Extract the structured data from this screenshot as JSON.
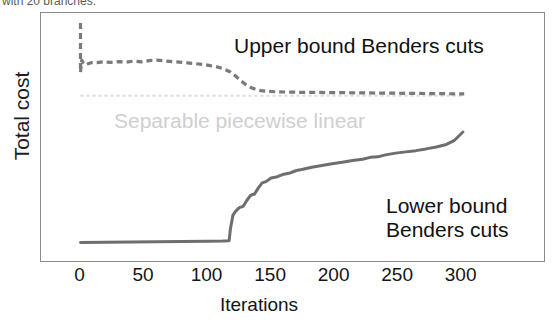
{
  "caption": {
    "text": "with 20 branches."
  },
  "chart_data": {
    "type": "line",
    "title": "",
    "subtitle": "",
    "xlabel": "Iterations",
    "ylabel": "Total cost",
    "xlim": [
      0,
      310
    ],
    "ylim": [
      0,
      100
    ],
    "grid": false,
    "legend_position": "in-plot annotations",
    "xticks": [
      0,
      50,
      100,
      150,
      200,
      250,
      300
    ],
    "xtick_labels": [
      "0",
      "50",
      "100",
      "150",
      "200",
      "250",
      "300"
    ],
    "yticks": [],
    "ytick_labels": [],
    "annotations": [
      {
        "name": "upper-bound-label",
        "text": "Upper bound Benders cuts",
        "color": "#111111"
      },
      {
        "name": "separable-label",
        "text": "Separable piecewise linear",
        "color": "#cfcfcf"
      },
      {
        "name": "lower-bound-label-line1",
        "text": "Lower bound",
        "color": "#111111"
      },
      {
        "name": "lower-bound-label-line2",
        "text": "Benders cuts",
        "color": "#111111"
      }
    ],
    "series": [
      {
        "name": "Upper bound Benders cuts",
        "style": "dashed",
        "color": "#7a7a7a",
        "x": [
          0,
          0,
          1,
          2,
          4,
          6,
          9,
          13,
          18,
          24,
          30,
          36,
          42,
          48,
          54,
          60,
          66,
          72,
          78,
          84,
          90,
          96,
          102,
          108,
          113,
          118,
          122,
          126,
          130,
          134,
          138,
          142,
          148,
          155,
          165,
          175,
          185,
          195,
          205,
          215,
          225,
          235,
          245,
          255,
          265,
          275,
          285,
          295,
          302
        ],
        "y": [
          96,
          76,
          81,
          80,
          79,
          79.5,
          80,
          80,
          80.3,
          80.1,
          80.4,
          80.2,
          80.6,
          80.3,
          80.8,
          81,
          80.7,
          80.4,
          80.2,
          79.9,
          79.6,
          79.3,
          78.8,
          78.2,
          77.4,
          76.2,
          74.6,
          72.8,
          71.2,
          70.0,
          69.2,
          68.7,
          68.4,
          68.2,
          68.1,
          68.0,
          68.0,
          67.9,
          67.9,
          67.8,
          67.8,
          67.7,
          67.7,
          67.6,
          67.6,
          67.5,
          67.5,
          67.4,
          67.4
        ]
      },
      {
        "name": "Separable piecewise linear",
        "style": "dotted",
        "color": "#dcdcdc",
        "x": [
          0,
          302
        ],
        "y": [
          66.6,
          66.6
        ]
      },
      {
        "name": "Lower bound Benders cuts",
        "style": "solid",
        "color": "#6e6e6e",
        "x": [
          0,
          20,
          40,
          60,
          80,
          100,
          112,
          117,
          118,
          120,
          122,
          125,
          128,
          131,
          134,
          137,
          140,
          143,
          146,
          150,
          155,
          160,
          165,
          170,
          175,
          182,
          190,
          198,
          206,
          214,
          222,
          228,
          234,
          240,
          248,
          256,
          264,
          272,
          280,
          288,
          294,
          298,
          301
        ],
        "y": [
          7.5,
          7.6,
          7.7,
          7.8,
          7.9,
          8.0,
          8.1,
          8.2,
          13.0,
          18.5,
          20.0,
          21.5,
          22.0,
          24.5,
          26.5,
          27.0,
          29.5,
          31.5,
          32.0,
          33.5,
          34.0,
          35.0,
          35.5,
          36.5,
          37.0,
          37.8,
          38.5,
          39.2,
          39.8,
          40.5,
          41.0,
          41.8,
          42.0,
          42.8,
          43.5,
          44.0,
          44.5,
          45.2,
          46.0,
          47.0,
          48.5,
          50.5,
          52.0
        ]
      }
    ]
  }
}
